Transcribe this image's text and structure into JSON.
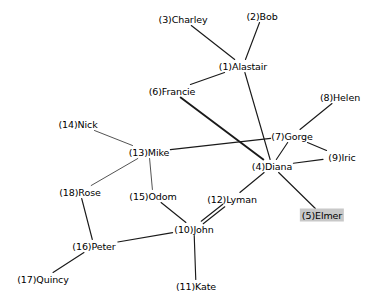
{
  "diagram": {
    "type": "node-link-graph",
    "background_color": "#ffffff",
    "edge_color": "#1a1a1a",
    "label_color": "#000000",
    "highlight_color": "#c8c8c8"
  },
  "nodes": [
    {
      "id": 1,
      "name": "Alastair",
      "label": "(1)Alastair",
      "x": 243,
      "y": 66,
      "highlighted": false
    },
    {
      "id": 2,
      "name": "Bob",
      "label": "(2)Bob",
      "x": 262,
      "y": 16,
      "highlighted": false
    },
    {
      "id": 3,
      "name": "Charley",
      "label": "(3)Charley",
      "x": 183,
      "y": 19,
      "highlighted": false
    },
    {
      "id": 4,
      "name": "Diana",
      "label": "(4)Diana",
      "x": 272,
      "y": 166,
      "highlighted": false
    },
    {
      "id": 5,
      "name": "Elmer",
      "label": "(5)Elmer",
      "x": 322,
      "y": 215,
      "highlighted": true
    },
    {
      "id": 6,
      "name": "Francie",
      "label": "(6)Francie",
      "x": 172,
      "y": 91,
      "highlighted": false
    },
    {
      "id": 7,
      "name": "Gorge",
      "label": "(7)Gorge",
      "x": 292,
      "y": 136,
      "highlighted": false
    },
    {
      "id": 8,
      "name": "Helen",
      "label": "(8)Helen",
      "x": 340,
      "y": 97,
      "highlighted": false
    },
    {
      "id": 9,
      "name": "Iric",
      "label": "(9)Iric",
      "x": 342,
      "y": 157,
      "highlighted": false
    },
    {
      "id": 10,
      "name": "John",
      "label": "(10)John",
      "x": 194,
      "y": 229,
      "highlighted": false
    },
    {
      "id": 11,
      "name": "Kate",
      "label": "(11)Kate",
      "x": 196,
      "y": 286,
      "highlighted": false
    },
    {
      "id": 12,
      "name": "Lyman",
      "label": "(12)Lyman",
      "x": 232,
      "y": 199,
      "highlighted": false
    },
    {
      "id": 13,
      "name": "Mike",
      "label": "(13)Mike",
      "x": 149,
      "y": 152,
      "highlighted": false
    },
    {
      "id": 14,
      "name": "Nick",
      "label": "(14)Nick",
      "x": 78,
      "y": 124,
      "highlighted": false
    },
    {
      "id": 15,
      "name": "Odom",
      "label": "(15)Odom",
      "x": 153,
      "y": 196,
      "highlighted": false
    },
    {
      "id": 16,
      "name": "Peter",
      "label": "(16)Peter",
      "x": 94,
      "y": 246,
      "highlighted": false
    },
    {
      "id": 17,
      "name": "Quincy",
      "label": "(17)Quincy",
      "x": 43,
      "y": 279,
      "highlighted": false
    },
    {
      "id": 18,
      "name": "Rose",
      "label": "(18)Rose",
      "x": 80,
      "y": 192,
      "highlighted": false
    }
  ],
  "edges": [
    {
      "source": 3,
      "target": 1,
      "weight": 1,
      "style": "normal"
    },
    {
      "source": 2,
      "target": 1,
      "weight": 1,
      "style": "normal"
    },
    {
      "source": 1,
      "target": 6,
      "weight": 1,
      "style": "normal"
    },
    {
      "source": 1,
      "target": 4,
      "weight": 1,
      "style": "normal"
    },
    {
      "source": 6,
      "target": 4,
      "weight": 2,
      "style": "thick"
    },
    {
      "source": 8,
      "target": 7,
      "weight": 1,
      "style": "normal"
    },
    {
      "source": 7,
      "target": 13,
      "weight": 1,
      "style": "normal"
    },
    {
      "source": 7,
      "target": 4,
      "weight": 1,
      "style": "normal"
    },
    {
      "source": 7,
      "target": 9,
      "weight": 1,
      "style": "normal"
    },
    {
      "source": 4,
      "target": 9,
      "weight": 1,
      "style": "normal"
    },
    {
      "source": 4,
      "target": 12,
      "weight": 1,
      "style": "normal"
    },
    {
      "source": 4,
      "target": 5,
      "weight": 1,
      "style": "normal"
    },
    {
      "source": 14,
      "target": 13,
      "weight": 1,
      "style": "thin"
    },
    {
      "source": 13,
      "target": 18,
      "weight": 1,
      "style": "thin"
    },
    {
      "source": 13,
      "target": 15,
      "weight": 1,
      "style": "thin"
    },
    {
      "source": 15,
      "target": 10,
      "weight": 1,
      "style": "normal"
    },
    {
      "source": 18,
      "target": 16,
      "weight": 1,
      "style": "normal"
    },
    {
      "source": 16,
      "target": 17,
      "weight": 1,
      "style": "normal"
    },
    {
      "source": 16,
      "target": 10,
      "weight": 1,
      "style": "normal"
    },
    {
      "source": 10,
      "target": 11,
      "weight": 1,
      "style": "normal"
    },
    {
      "source": 10,
      "target": 12,
      "weight": 1,
      "style": "parallel-a"
    },
    {
      "source": 10,
      "target": 12,
      "weight": 1,
      "style": "parallel-b"
    }
  ]
}
